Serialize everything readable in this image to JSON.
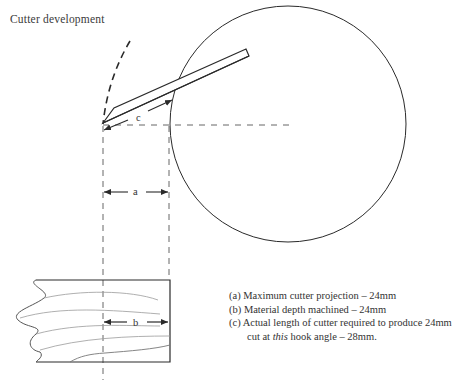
{
  "title": "Cutter development",
  "labels": {
    "a": "a",
    "b": "b",
    "c": "c"
  },
  "legend": [
    {
      "key": "(a)",
      "text": "Maximum cutter projection – 24mm"
    },
    {
      "key": "(b)",
      "text": "Material depth machined – 24mm"
    },
    {
      "key": "(c)",
      "text": "Actual length of cutter required to produce 24mm"
    }
  ],
  "legend_continuation": {
    "pre": "cut at ",
    "emph": "this",
    "post": " hook angle – 28mm."
  },
  "colors": {
    "line": "#2a2a2a",
    "dashed": "#555555",
    "grain": "#9a9a9a"
  }
}
